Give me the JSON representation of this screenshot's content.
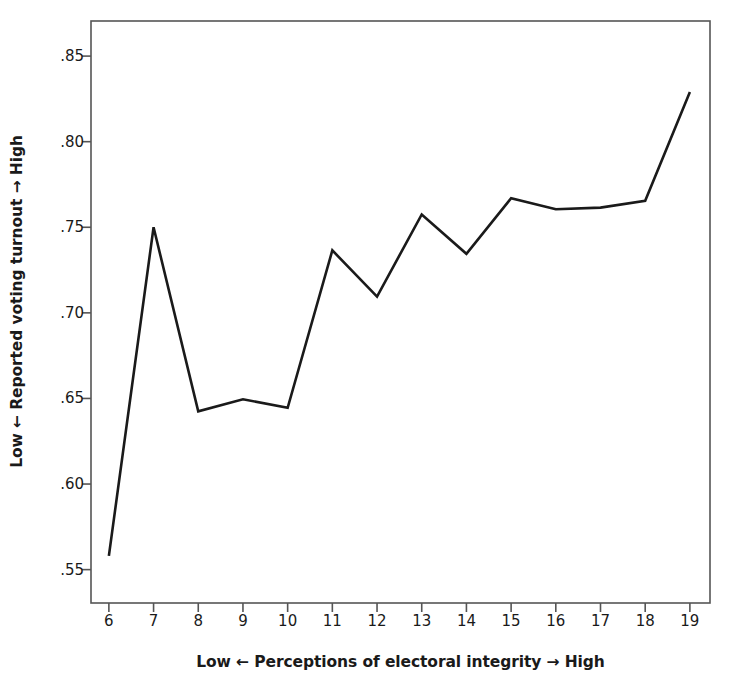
{
  "chart_data": {
    "type": "line",
    "title": "",
    "subtitle": "",
    "xlabel": "Low ← Perceptions of electoral integrity → High",
    "ylabel": "Low ← Reported voting turnout → High",
    "x": [
      6,
      7,
      8,
      9,
      10,
      11,
      12,
      13,
      14,
      15,
      16,
      17,
      18,
      19
    ],
    "values": [
      0.558,
      0.75,
      0.6425,
      0.6495,
      0.6445,
      0.7365,
      0.7095,
      0.7575,
      0.7345,
      0.767,
      0.7605,
      0.7615,
      0.7655,
      0.829
    ],
    "series": [
      {
        "name": "Reported voting turnout",
        "values": [
          0.558,
          0.75,
          0.6425,
          0.6495,
          0.6445,
          0.7365,
          0.7095,
          0.7575,
          0.7345,
          0.767,
          0.7605,
          0.7615,
          0.7655,
          0.829
        ]
      }
    ],
    "xtick_labels": [
      "6",
      "7",
      "8",
      "9",
      "10",
      "11",
      "12",
      "13",
      "14",
      "15",
      "16",
      "17",
      "18",
      "19"
    ],
    "ytick_labels": [
      ".85",
      ".80",
      ".75",
      ".70",
      ".65",
      ".60",
      ".55"
    ],
    "ytick_values": [
      0.85,
      0.8,
      0.75,
      0.7,
      0.65,
      0.6,
      0.55
    ],
    "xlim": [
      5.6,
      19.45
    ],
    "ylim": [
      0.5305,
      0.8705
    ],
    "grid": false,
    "legend": "none",
    "line_color": "#1a1a1a",
    "frame_color": "#555555",
    "background_color": "#ffffff"
  },
  "axis_labels": {
    "y_title": "Low ← Reported voting turnout → High",
    "x_title": "Low ← Perceptions of electoral integrity → High"
  }
}
